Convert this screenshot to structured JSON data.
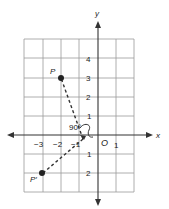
{
  "diagram": {
    "type": "coordinate-plane-rotation",
    "axes": {
      "x_label": "x",
      "y_label": "y",
      "origin_label": "O"
    },
    "x_ticks": [
      {
        "value": -3,
        "label": "−3"
      },
      {
        "value": -2,
        "label": "−2"
      },
      {
        "value": -1,
        "label": "−1"
      },
      {
        "value": 1,
        "label": "1"
      }
    ],
    "y_ticks": [
      {
        "value": 4,
        "label": "4"
      },
      {
        "value": 3,
        "label": "3"
      },
      {
        "value": 2,
        "label": "2"
      },
      {
        "value": 1,
        "label": "1"
      },
      {
        "value": -1,
        "label": "1"
      },
      {
        "value": -2,
        "label": "2"
      }
    ],
    "points": [
      {
        "name": "P",
        "label": "P",
        "x": -2,
        "y": 3
      },
      {
        "name": "P-prime",
        "label": "P′",
        "x": -3,
        "y": -2
      }
    ],
    "angle_label": "90°",
    "grid": {
      "x_min": -4,
      "x_max": 2,
      "y_min": -3,
      "y_max": 5
    },
    "colors": {
      "grid": "#9a9a9a",
      "axis": "#333333",
      "point": "#222222"
    }
  }
}
